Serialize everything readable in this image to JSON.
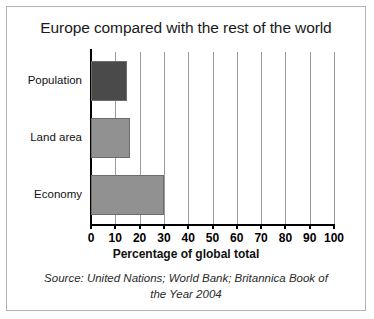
{
  "figure": {
    "title": "Europe compared with the rest of the world",
    "source_line_1": "Source: United Nations; World Bank; Britannica Book of",
    "source_line_2": "the Year 2004"
  },
  "chart_data": {
    "type": "bar",
    "orientation": "horizontal",
    "title": "Europe compared with the rest of the world",
    "categories": [
      "Population",
      "Land area",
      "Economy"
    ],
    "values": [
      15,
      16,
      30
    ],
    "bar_colors": [
      "#4a4a4a",
      "#919191",
      "#919191"
    ],
    "xlabel": "Percentage of global total",
    "ylabel": "",
    "xlim": [
      0,
      100
    ],
    "xticks": [
      0,
      10,
      20,
      30,
      40,
      50,
      60,
      70,
      80,
      90,
      100
    ],
    "xtick_labels": [
      "0",
      "10",
      "20",
      "30",
      "40",
      "50",
      "60",
      "70",
      "80",
      "90",
      "100"
    ],
    "grid": "vertical",
    "legend": "none",
    "source": "Source: United Nations; World Bank; Britannica Book of the Year 2004"
  }
}
